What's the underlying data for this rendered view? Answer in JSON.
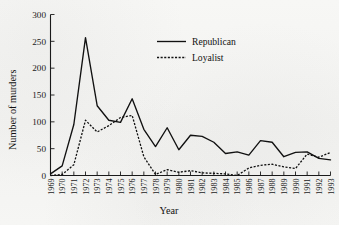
{
  "chart_data": {
    "type": "line",
    "title": "",
    "xlabel": "Year",
    "ylabel": "Number of murders",
    "xlim": [
      1969,
      1993
    ],
    "ylim": [
      0,
      300
    ],
    "yticks": [
      0,
      50,
      100,
      150,
      200,
      250,
      300
    ],
    "grid": false,
    "legend_position": "top-center",
    "x": [
      1969,
      1970,
      1971,
      1972,
      1973,
      1974,
      1975,
      1976,
      1977,
      1978,
      1979,
      1980,
      1981,
      1982,
      1983,
      1984,
      1985,
      1986,
      1987,
      1988,
      1989,
      1990,
      1991,
      1992,
      1993
    ],
    "categories": [
      "1969",
      "1970",
      "1971",
      "1972",
      "1973",
      "1974",
      "1975",
      "1976",
      "1977",
      "1978",
      "1979",
      "1980",
      "1981",
      "1982",
      "1983",
      "1984",
      "1985",
      "1986",
      "1987",
      "1988",
      "1989",
      "1990",
      "1991",
      "1992",
      "1993"
    ],
    "series": [
      {
        "name": "Republican",
        "style": "solid",
        "color": "#111111",
        "values": [
          3,
          18,
          95,
          257,
          130,
          103,
          99,
          143,
          86,
          54,
          89,
          48,
          75,
          73,
          62,
          41,
          44,
          38,
          65,
          62,
          35,
          43,
          44,
          32,
          29
        ]
      },
      {
        "name": "Loyalist",
        "style": "dotted",
        "color": "#111111",
        "values": [
          0,
          2,
          20,
          103,
          81,
          93,
          108,
          112,
          35,
          2,
          11,
          6,
          9,
          5,
          4,
          3,
          0,
          14,
          19,
          21,
          16,
          13,
          40,
          34,
          43
        ]
      }
    ]
  },
  "axis": {
    "y_label": "Number of murders",
    "x_label": "Year",
    "y_tick_labels": [
      "0",
      "50",
      "100",
      "150",
      "200",
      "250",
      "300"
    ]
  },
  "legend": {
    "entries": [
      {
        "label": "Republican",
        "style": "solid"
      },
      {
        "label": "Loyalist",
        "style": "dotted"
      }
    ]
  }
}
